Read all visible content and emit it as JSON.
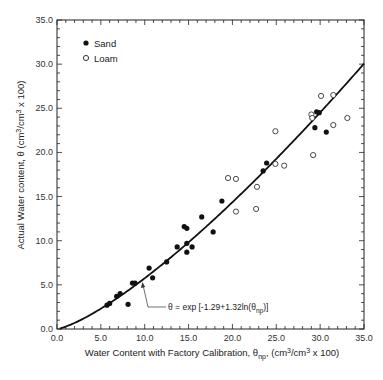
{
  "chart_data": {
    "type": "scatter",
    "title": "",
    "xlabel": "Water Content with Factory Calibration, θnp, (cm³/cm³ x 100)",
    "xlabel_parts": {
      "main": "Water Content with Factory Calibration, θ",
      "sub": "np",
      "rest": ", (cm",
      "sup1": "3",
      "mid": "/cm",
      "sup2": "3",
      "end": " x 100)"
    },
    "ylabel": "Actual Water content, θ (cm³/cm³ x 100)",
    "ylabel_parts": {
      "main": "Actual Water content, θ (cm",
      "sup1": "3",
      "mid": "/cm",
      "sup2": "3",
      "end": " x 100)"
    },
    "xlim": [
      0,
      35
    ],
    "ylim": [
      0,
      35
    ],
    "x_ticks": [
      "0.0",
      "5.0",
      "10.0",
      "15.0",
      "20.0",
      "25.0",
      "30.0",
      "35.0"
    ],
    "y_ticks": [
      "0.0",
      "5.0",
      "10.0",
      "15.0",
      "20.0",
      "25.0",
      "30.0",
      "35.0"
    ],
    "minor_tick_step": 1,
    "grid": false,
    "legend_position": "upper-left",
    "series": [
      {
        "name": "Sand",
        "marker": "filled-circle",
        "points": [
          [
            5.7,
            2.7
          ],
          [
            6.0,
            2.9
          ],
          [
            6.8,
            3.7
          ],
          [
            7.2,
            4.0
          ],
          [
            8.1,
            2.8
          ],
          [
            8.6,
            5.2
          ],
          [
            8.9,
            5.2
          ],
          [
            10.5,
            6.9
          ],
          [
            10.9,
            5.8
          ],
          [
            12.5,
            7.6
          ],
          [
            13.7,
            9.3
          ],
          [
            14.5,
            11.6
          ],
          [
            14.8,
            11.4
          ],
          [
            14.8,
            9.7
          ],
          [
            15.4,
            9.3
          ],
          [
            14.8,
            8.7
          ],
          [
            16.5,
            12.7
          ],
          [
            17.8,
            11.0
          ],
          [
            18.8,
            14.5
          ],
          [
            23.5,
            17.9
          ],
          [
            23.9,
            18.8
          ],
          [
            29.4,
            22.8
          ],
          [
            29.6,
            24.6
          ],
          [
            29.9,
            24.5
          ],
          [
            30.7,
            22.3
          ]
        ]
      },
      {
        "name": "Loam",
        "marker": "open-circle",
        "points": [
          [
            19.5,
            17.1
          ],
          [
            20.4,
            17.0
          ],
          [
            20.4,
            13.3
          ],
          [
            22.7,
            13.6
          ],
          [
            22.8,
            16.1
          ],
          [
            24.9,
            18.7
          ],
          [
            25.9,
            18.5
          ],
          [
            24.9,
            22.4
          ],
          [
            29.0,
            24.3
          ],
          [
            29.1,
            23.9
          ],
          [
            29.2,
            19.7
          ],
          [
            30.1,
            26.4
          ],
          [
            31.5,
            26.5
          ],
          [
            31.5,
            23.1
          ],
          [
            33.1,
            23.9
          ]
        ]
      },
      {
        "name": "Fit",
        "type": "line",
        "equation": "θ = exp[-1.29 + 1.32 ln(θnp)]",
        "a": -1.29,
        "b": 1.32
      }
    ],
    "annotations": [
      {
        "text": "θ = exp [-1.29+1.32ln(θnp)]",
        "main": "θ = exp [-1.29+1.32ln(θ",
        "sub": "np",
        "end": ")]",
        "arrow_to": [
          9.8,
          6.1
        ]
      }
    ],
    "legend": [
      {
        "label": "Sand",
        "marker": "filled-circle"
      },
      {
        "label": "Loam",
        "marker": "open-circle"
      }
    ]
  }
}
